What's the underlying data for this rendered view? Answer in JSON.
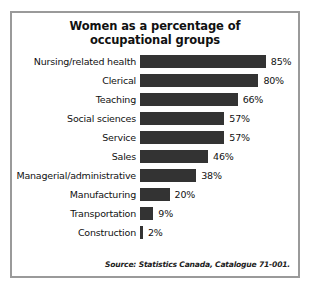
{
  "chart_data": {
    "type": "bar",
    "orientation": "horizontal",
    "title": "Women as a percentage of occupational groups",
    "title_lines": [
      "Women as a percentage of",
      "occupational groups"
    ],
    "categories": [
      "Nursing/related health",
      "Clerical",
      "Teaching",
      "Social sciences",
      "Service",
      "Sales",
      "Managerial/administrative",
      "Manufacturing",
      "Transportation",
      "Construction"
    ],
    "values": [
      85,
      80,
      66,
      57,
      57,
      46,
      38,
      20,
      9,
      2
    ],
    "value_labels": [
      "85%",
      "80%",
      "66%",
      "57%",
      "57%",
      "46%",
      "38%",
      "20%",
      "9%",
      "2%"
    ],
    "unit": "%",
    "xlabel": "",
    "ylabel": "",
    "xlim": [
      0,
      100
    ],
    "grid": false,
    "legend": false,
    "bar_color": "#333333",
    "frame_color": "#9a9a9a",
    "background_color": "#ffffff",
    "px_per_percent": 1.48
  },
  "source": {
    "text": "Source: Statistics Canada, Catalogue 71-001."
  }
}
